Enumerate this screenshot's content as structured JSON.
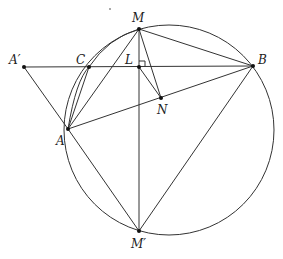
{
  "diagram": {
    "type": "geometry-figure",
    "points": {
      "A_prime": {
        "label": "A′",
        "x": 24,
        "y": 67
      },
      "C": {
        "label": "C",
        "x": 89,
        "y": 67
      },
      "L": {
        "label": "L",
        "x": 139,
        "y": 67
      },
      "B": {
        "label": "B",
        "x": 253,
        "y": 66
      },
      "M": {
        "label": "M",
        "x": 139,
        "y": 29
      },
      "N": {
        "label": "N",
        "x": 161,
        "y": 98
      },
      "A": {
        "label": "A",
        "x": 68,
        "y": 129
      },
      "M_prime": {
        "label": "M′",
        "x": 139,
        "y": 231
      }
    },
    "segments": [
      [
        "A_prime",
        "B"
      ],
      [
        "A_prime",
        "A"
      ],
      [
        "A",
        "C"
      ],
      [
        "A",
        "M"
      ],
      [
        "A",
        "B"
      ],
      [
        "A",
        "M_prime"
      ],
      [
        "M",
        "B"
      ],
      [
        "M",
        "M_prime"
      ],
      [
        "M",
        "N"
      ],
      [
        "L",
        "N"
      ],
      [
        "B",
        "M_prime"
      ]
    ],
    "circles": [
      {
        "name": "circumcircle",
        "cx": 169,
        "cy": 130,
        "r": 105
      },
      {
        "name": "arc-A-C-M",
        "through": [
          "A",
          "C",
          "M"
        ]
      }
    ],
    "right_angle_at": "L",
    "marks": {
      "dot_top": {
        "x": 110,
        "y": 9
      }
    }
  }
}
